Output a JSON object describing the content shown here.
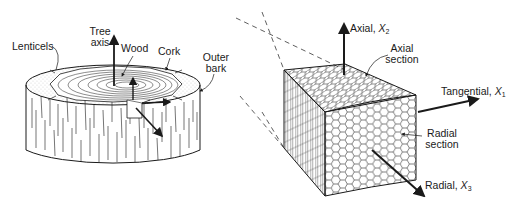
{
  "diagram": {
    "colors": {
      "ink": "#1a1a1a",
      "background": "#ffffff",
      "stipple": "#666666"
    },
    "log": {
      "labels": {
        "tree_axis_line1": "Tree",
        "tree_axis_line2": "axis",
        "lenticels": "Lenticels",
        "wood": "Wood",
        "cork": "Cork",
        "outer_bark_line1": "Outer",
        "outer_bark_line2": "bark"
      }
    },
    "cube": {
      "labels": {
        "axial_axis": "Axial, ",
        "axial_var": "X",
        "axial_sub": "2",
        "axial_section_line1": "Axial",
        "axial_section_line2": "section",
        "tangential_axis": "Tangential, ",
        "tangential_var": "X",
        "tangential_sub": "1",
        "radial_section_line1": "Radial",
        "radial_section_line2": "section",
        "radial_axis": "Radial, ",
        "radial_var": "X",
        "radial_sub": "3"
      }
    }
  }
}
